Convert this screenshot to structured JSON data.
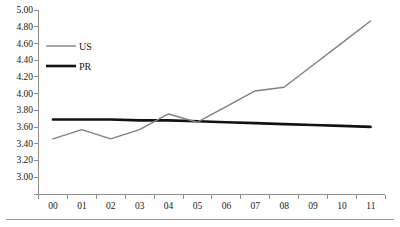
{
  "chart_data": {
    "type": "line",
    "title": "",
    "subtitle": "",
    "xlabel": "",
    "ylabel": "",
    "x": [
      "00",
      "01",
      "02",
      "03",
      "04",
      "05",
      "06",
      "07",
      "08",
      "09",
      "10",
      "11"
    ],
    "categories": [
      "00",
      "01",
      "02",
      "03",
      "04",
      "05",
      "06",
      "07",
      "08",
      "09",
      "10",
      "11"
    ],
    "series": [
      {
        "name": "US",
        "color": "#808080",
        "line_width": "thin",
        "values": [
          3.6,
          3.7,
          3.6,
          3.7,
          3.87,
          3.78,
          3.95,
          4.12,
          4.16,
          4.4,
          4.64,
          4.88
        ]
      },
      {
        "name": "PR",
        "color": "#121212",
        "line_width": "thick",
        "values": [
          3.81,
          3.81,
          3.81,
          3.8,
          3.8,
          3.79,
          3.78,
          3.77,
          3.76,
          3.75,
          3.74,
          3.73
        ]
      }
    ],
    "ylim": [
      3.0,
      5.0
    ],
    "ytick_step": 0.2,
    "ytick_labels": [
      "5.00",
      "4.80",
      "4.60",
      "4.40",
      "4.20",
      "4.00",
      "3.80",
      "3.60",
      "3.40",
      "3.20",
      "3.00"
    ],
    "xtick_labels": [
      "00",
      "01",
      "02",
      "03",
      "04",
      "05",
      "06",
      "07",
      "08",
      "09",
      "10",
      "11"
    ],
    "grid": false,
    "legend_position": "upper-left-inside",
    "legend_entries": [
      {
        "label": "US",
        "color": "#808080"
      },
      {
        "label": "PR",
        "color": "#121212"
      }
    ]
  },
  "axes": {
    "y_axis_name": "value-axis",
    "x_axis_name": "year-axis"
  }
}
